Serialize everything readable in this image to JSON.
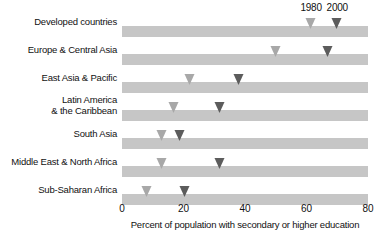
{
  "chart_data": {
    "type": "bar",
    "title": "",
    "subtitle": "",
    "xlabel": "Percent of population with secondary or higher education",
    "ylabel": "",
    "xlim": [
      0,
      80
    ],
    "grid": false,
    "legend_position": "top-right",
    "orientation": "horizontal",
    "marker_style": "downward-triangle",
    "categories": [
      "Developed countries",
      "Europe & Central Asia",
      "East Asia & Pacific",
      "Latin America\n& the Caribbean",
      "South Asia",
      "Middle East & North Africa",
      "Sub-Saharan Africa"
    ],
    "series": [
      {
        "name": "1980",
        "color": "#a8a8a8",
        "values": [
          61.5,
          50,
          22,
          17,
          13,
          13,
          8
        ]
      },
      {
        "name": "2000",
        "color": "#5c5c5c",
        "values": [
          70,
          67,
          38,
          32,
          19,
          32,
          20.5
        ]
      }
    ],
    "xticks": [
      0,
      20,
      40,
      60,
      80
    ],
    "xtick_labels": [
      "0",
      "20",
      "40",
      "60",
      "80"
    ],
    "bar_color": "#c6c6c6"
  },
  "legend": {
    "items": [
      {
        "label": "1980",
        "value": 61.5
      },
      {
        "label": "2000",
        "value": 70
      }
    ]
  },
  "axis": {
    "title": "Percent of population with secondary or higher education",
    "ticks": [
      "0",
      "20",
      "40",
      "60",
      "80"
    ]
  }
}
